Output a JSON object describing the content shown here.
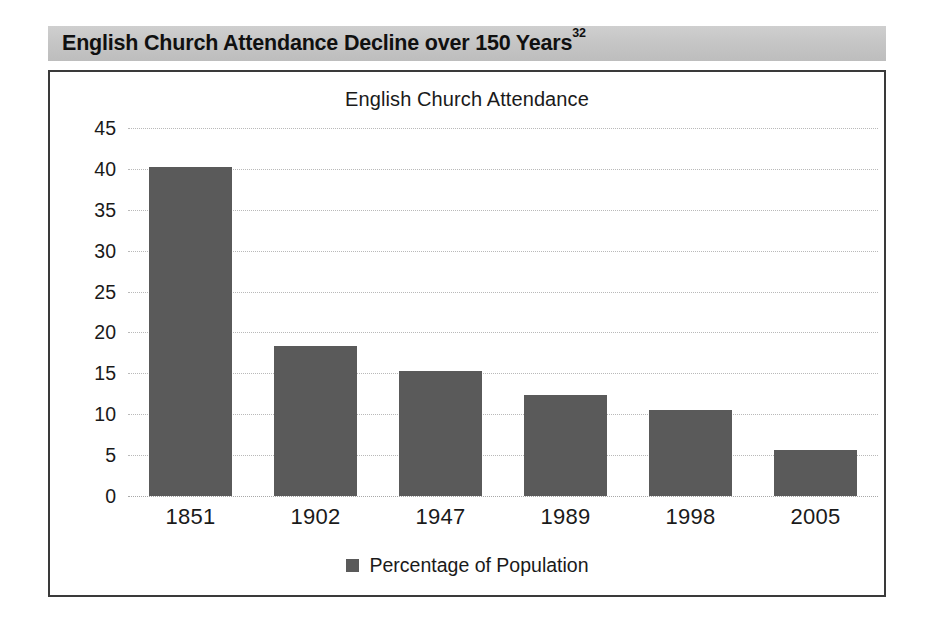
{
  "figure": {
    "caption": "English Church Attendance Decline over 150 Years",
    "footnote_marker": "32"
  },
  "chart_data": {
    "type": "bar",
    "title": "English Church Attendance",
    "xlabel": "",
    "ylabel": "",
    "categories": [
      "1851",
      "1902",
      "1947",
      "1989",
      "1998",
      "2005"
    ],
    "series": [
      {
        "name": "Percentage of Population",
        "color": "#5a5a5a",
        "values": [
          40.2,
          18.3,
          15.3,
          12.4,
          10.5,
          5.6
        ]
      }
    ],
    "ylim": [
      0,
      45
    ],
    "ytick_labels": [
      "0",
      "5",
      "10",
      "15",
      "20",
      "25",
      "30",
      "35",
      "40",
      "45"
    ],
    "ytick_values": [
      0,
      5,
      10,
      15,
      20,
      25,
      30,
      35,
      40,
      45
    ],
    "grid": true,
    "grid_style": "dotted",
    "grid_color": "#b9b9b9",
    "legend": {
      "position": "bottom",
      "entries": [
        {
          "label": "Percentage of Population",
          "color": "#5a5a5a"
        }
      ]
    }
  },
  "colors": {
    "banner_background": "#c6c6c6",
    "frame_border": "#3a3a3a",
    "bar_fill": "#5a5a5a",
    "text": "#1a1a1a",
    "page_background": "#ffffff"
  }
}
